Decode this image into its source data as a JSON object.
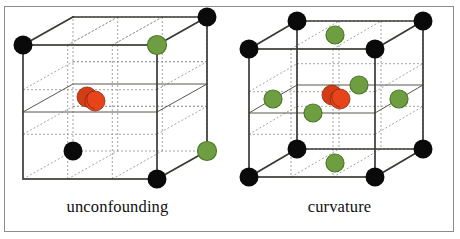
{
  "figure": {
    "border_color": "#8c8c8c",
    "background": "#ffffff",
    "top_artifact_text": "·      ·        ·       ·          ·        ·       ·"
  },
  "palette": {
    "vertex_black": "#0a0a0a",
    "vertex_green": "#6f9e42",
    "vertex_green_edge": "#4d7a28",
    "center_red": "#e8441c",
    "center_red_dark": "#b33214",
    "edge_solid": "#3d3a35",
    "edge_dashed": "#9a9a9a"
  },
  "panels": [
    {
      "id": "unconfounding",
      "caption": "unconfounding",
      "description": "Two-level factorial cube plot with alternating black and green corner points and a replicated red center point.",
      "corner_points": [
        {
          "name": "back-top-left",
          "color": "black",
          "visible": false
        },
        {
          "name": "back-top-right",
          "color": "black",
          "visible": true
        },
        {
          "name": "front-top-left",
          "color": "black",
          "visible": true
        },
        {
          "name": "front-top-right",
          "color": "green",
          "visible": true
        },
        {
          "name": "back-bottom-left",
          "color": "black",
          "visible": false
        },
        {
          "name": "back-bottom-right",
          "color": "green",
          "visible": true
        },
        {
          "name": "front-bottom-left",
          "color": "black",
          "visible": true
        },
        {
          "name": "front-bottom-right",
          "color": "black",
          "visible": true
        }
      ],
      "center_points": 2,
      "face_center_points": 0,
      "counts": {
        "black": 5,
        "green": 3,
        "red": 2
      }
    },
    {
      "id": "curvature",
      "caption": "curvature",
      "description": "Face-centered cube (central composite) design: eight black corner points, six green face-center axial points and a replicated red center point.",
      "corner_points": [
        {
          "name": "back-top-left",
          "color": "black",
          "visible": true
        },
        {
          "name": "back-top-right",
          "color": "black",
          "visible": true
        },
        {
          "name": "front-top-left",
          "color": "black",
          "visible": true
        },
        {
          "name": "front-top-right",
          "color": "black",
          "visible": true
        },
        {
          "name": "back-bottom-left",
          "color": "black",
          "visible": true
        },
        {
          "name": "back-bottom-right",
          "color": "black",
          "visible": true
        },
        {
          "name": "front-bottom-left",
          "color": "black",
          "visible": true
        },
        {
          "name": "front-bottom-right",
          "color": "black",
          "visible": true
        }
      ],
      "face_center_points": 6,
      "center_points": 2,
      "counts": {
        "black": 8,
        "green": 6,
        "red": 2
      }
    }
  ]
}
